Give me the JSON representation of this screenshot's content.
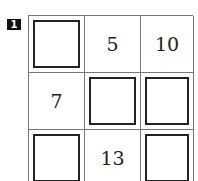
{
  "problem_number": "1",
  "grid": [
    [
      {
        "type": "blank"
      },
      {
        "type": "number",
        "value": "5"
      },
      {
        "type": "number",
        "value": "10"
      }
    ],
    [
      {
        "type": "number",
        "value": "7"
      },
      {
        "type": "blank"
      },
      {
        "type": "blank"
      }
    ],
    [
      {
        "type": "blank"
      },
      {
        "type": "number",
        "value": "13"
      },
      {
        "type": "blank"
      }
    ]
  ]
}
